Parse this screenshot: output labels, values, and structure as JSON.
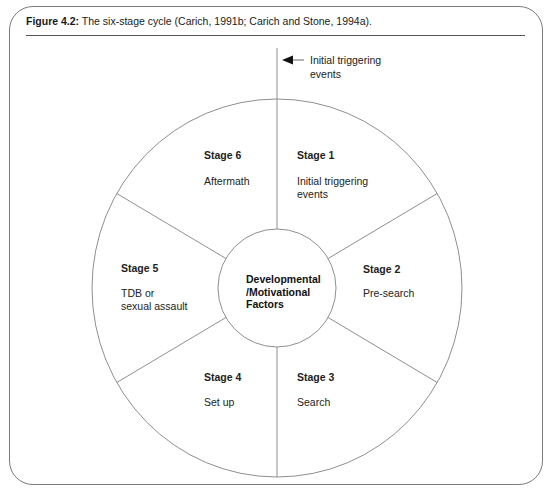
{
  "figure": {
    "label": "Figure 4.2:",
    "caption": " The six-stage cycle (Carich, 1991b; Carich and Stone, 1994a)."
  },
  "trigger": {
    "icon": "arrow-left-icon",
    "line1": "Initial triggering",
    "line2": "events"
  },
  "center": {
    "line1": "Developmental",
    "line2": "/Motivational",
    "line3": "Factors"
  },
  "stages": [
    {
      "title": "Stage 1",
      "line1": "Initial triggering",
      "line2": "events"
    },
    {
      "title": "Stage 2",
      "line1": "Pre-search",
      "line2": ""
    },
    {
      "title": "Stage 3",
      "line1": "Search",
      "line2": ""
    },
    {
      "title": "Stage 4",
      "line1": "Set up",
      "line2": ""
    },
    {
      "title": "Stage 5",
      "line1": "TDB or",
      "line2": "sexual assault"
    },
    {
      "title": "Stage 6",
      "line1": "Aftermath",
      "line2": ""
    }
  ],
  "colors": {
    "line": "#9a9a9a",
    "frame": "#7a7a7a",
    "text": "#1a1a1a"
  }
}
